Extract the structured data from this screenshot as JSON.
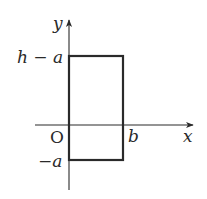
{
  "diagram": {
    "type": "coordinate-plane-rectangle",
    "axes": {
      "x_label": "x",
      "y_label": "y",
      "origin_label": "O"
    },
    "rectangle": {
      "x_min_label": "O",
      "x_max_label": "b",
      "y_max_label": "h − a",
      "y_min_label": "−a"
    },
    "labels": {
      "h_minus_a": "h − a",
      "minus_a": "−a",
      "b": "b",
      "x": "x",
      "y": "y",
      "origin": "O"
    },
    "colors": {
      "line": "#2a2a2a",
      "background": "#ffffff"
    }
  }
}
